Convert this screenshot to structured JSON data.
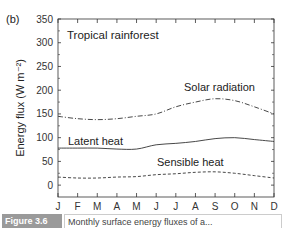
{
  "panel_label": "(b)",
  "chart_data": {
    "type": "line",
    "title": "Tropical rainforest",
    "xlabel": "",
    "ylabel": "Energy flux (W m⁻²)",
    "ylim": [
      -25,
      350
    ],
    "yticks": [
      0,
      50,
      100,
      150,
      200,
      250,
      300,
      350
    ],
    "categories": [
      "J",
      "F",
      "M",
      "A",
      "M",
      "J",
      "J",
      "A",
      "S",
      "O",
      "N",
      "D"
    ],
    "grid": false,
    "series": [
      {
        "name": "Solar radiation",
        "style": "dash-dot",
        "values": [
          145,
          140,
          138,
          140,
          145,
          150,
          165,
          175,
          182,
          178,
          165,
          150
        ]
      },
      {
        "name": "Latent heat",
        "style": "solid",
        "values": [
          78,
          78,
          78,
          76,
          76,
          85,
          88,
          92,
          98,
          100,
          96,
          92
        ]
      },
      {
        "name": "Sensible heat",
        "style": "dashed",
        "values": [
          17,
          15,
          15,
          17,
          18,
          22,
          24,
          27,
          28,
          25,
          20,
          15
        ]
      }
    ],
    "annotations": [
      {
        "text": "Tropical rainforest"
      },
      {
        "text": "Solar radiation"
      },
      {
        "text": "Latent heat"
      },
      {
        "text": "Sensible heat"
      }
    ]
  },
  "caption": {
    "label": "Figure 3.6",
    "text": "Monthly surface energy fluxes of a..."
  }
}
